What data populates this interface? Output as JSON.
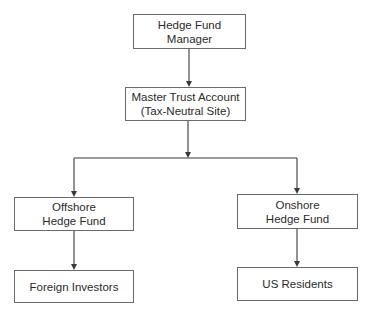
{
  "diagram": {
    "type": "flowchart",
    "orientation": "top-down",
    "nodes": {
      "manager": {
        "lines": [
          "Hedge Fund",
          "Manager"
        ]
      },
      "master_trust": {
        "lines": [
          "Master Trust Account",
          "(Tax-Neutral Site)"
        ]
      },
      "offshore": {
        "lines": [
          "Offshore",
          "Hedge Fund"
        ]
      },
      "onshore": {
        "lines": [
          "Onshore",
          "Hedge Fund"
        ]
      },
      "foreign_investors": {
        "lines": [
          "Foreign Investors"
        ]
      },
      "us_residents": {
        "lines": [
          "US Residents"
        ]
      }
    },
    "edges": [
      {
        "from": "Hedge Fund Manager",
        "to": "Master Trust Account (Tax-Neutral Site)"
      },
      {
        "from": "Master Trust Account (Tax-Neutral Site)",
        "to": "Offshore Hedge Fund"
      },
      {
        "from": "Master Trust Account (Tax-Neutral Site)",
        "to": "Onshore Hedge Fund"
      },
      {
        "from": "Offshore Hedge Fund",
        "to": "Foreign Investors"
      },
      {
        "from": "Onshore Hedge Fund",
        "to": "US Residents"
      }
    ],
    "colors": {
      "line": "#3a3a3a",
      "box_border": "#6a6a6a",
      "text": "#2b2b2b",
      "background": "#ffffff"
    }
  }
}
